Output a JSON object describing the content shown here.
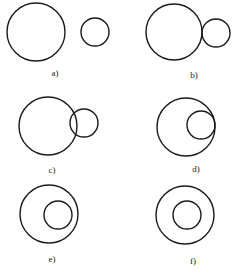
{
  "diagram": {
    "stroke_color": "#1a1a1a",
    "background": "#ffffff",
    "panels": [
      {
        "id": "a",
        "label": "a)",
        "relation": "separate",
        "label_pos": [
          55,
          76
        ],
        "big": {
          "cx": 36,
          "cy": 32,
          "r": 29
        },
        "small": {
          "cx": 95,
          "cy": 32,
          "r": 14
        }
      },
      {
        "id": "b",
        "label": "b)",
        "relation": "externally-tangent",
        "label_pos": [
          194,
          78
        ],
        "big": {
          "cx": 174,
          "cy": 32,
          "r": 28
        },
        "small": {
          "cx": 216,
          "cy": 33,
          "r": 14
        }
      },
      {
        "id": "c",
        "label": "c)",
        "relation": "intersecting",
        "label_pos": [
          52,
          173
        ],
        "big": {
          "cx": 48,
          "cy": 126,
          "r": 29
        },
        "small": {
          "cx": 84,
          "cy": 123,
          "r": 14
        }
      },
      {
        "id": "d",
        "label": "d)",
        "relation": "internally-tangent",
        "label_pos": [
          196,
          172
        ],
        "big": {
          "cx": 186,
          "cy": 127,
          "r": 29
        },
        "small": {
          "cx": 201,
          "cy": 125,
          "r": 14
        }
      },
      {
        "id": "e",
        "label": "e)",
        "relation": "contained",
        "label_pos": [
          52,
          262
        ],
        "big": {
          "cx": 49,
          "cy": 214,
          "r": 29
        },
        "small": {
          "cx": 58,
          "cy": 215,
          "r": 14
        }
      },
      {
        "id": "f",
        "label": "f)",
        "relation": "concentric",
        "label_pos": [
          193,
          264
        ],
        "big": {
          "cx": 185,
          "cy": 215,
          "r": 29
        },
        "small": {
          "cx": 187,
          "cy": 215,
          "r": 14
        }
      }
    ]
  }
}
